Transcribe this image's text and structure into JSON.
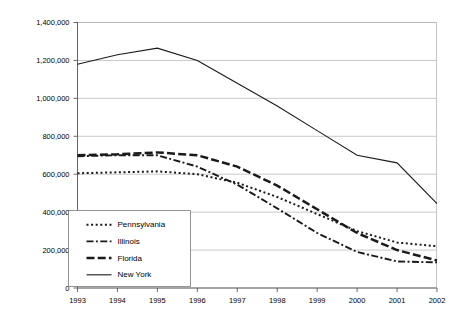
{
  "chart_data": {
    "type": "line",
    "title": "",
    "xlabel": "",
    "ylabel": "",
    "grid": true,
    "legend_position": "inside-lower-left",
    "categories": [
      1993,
      1994,
      1995,
      1996,
      1997,
      1998,
      1999,
      2000,
      2001,
      2002
    ],
    "x_tick_labels": [
      "1993",
      "1994",
      "1995",
      "1996",
      "1997",
      "1998",
      "1999",
      "2000",
      "2001",
      "2002"
    ],
    "y_tick_labels": [
      "0",
      "200,000",
      "400,000",
      "600,000",
      "800,000",
      "1,000,000",
      "1,200,000",
      "1,400,000"
    ],
    "y_tick_values": [
      0,
      200000,
      400000,
      600000,
      800000,
      1000000,
      1200000,
      1400000
    ],
    "ylim": [
      0,
      1400000
    ],
    "xlim": [
      1993,
      2002
    ],
    "series": [
      {
        "name": "Pennsylvania",
        "style": "dotted",
        "values": [
          605000,
          610000,
          615000,
          600000,
          555000,
          480000,
          390000,
          300000,
          240000,
          220000
        ]
      },
      {
        "name": "Illinois",
        "style": "dash-dot",
        "values": [
          695000,
          700000,
          700000,
          640000,
          545000,
          420000,
          290000,
          190000,
          140000,
          135000
        ]
      },
      {
        "name": "Florida",
        "style": "dashed-thick",
        "values": [
          700000,
          705000,
          715000,
          700000,
          640000,
          540000,
          415000,
          290000,
          200000,
          145000
        ]
      },
      {
        "name": "New York",
        "style": "solid",
        "values": [
          1180000,
          1230000,
          1265000,
          1200000,
          1080000,
          960000,
          830000,
          700000,
          660000,
          445000
        ]
      }
    ]
  },
  "legend": {
    "items": [
      {
        "label": "Pennsylvania",
        "swatch": "dotted-line-swatch"
      },
      {
        "label": "Illinois",
        "swatch": "dash-dot-line-swatch"
      },
      {
        "label": "Florida",
        "swatch": "thick-dashed-line-swatch"
      },
      {
        "label": "New York",
        "swatch": "solid-line-swatch"
      }
    ]
  },
  "colors": {
    "series": "#1a1a1a",
    "gridline": "#b0b0b0",
    "axis": "#5a5a5a",
    "background": "#ffffff"
  }
}
